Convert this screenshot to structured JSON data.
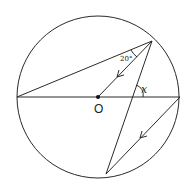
{
  "diagram": {
    "type": "circle-geometry",
    "circle": {
      "cx": 98,
      "cy": 97,
      "r": 81
    },
    "center": {
      "x": 98,
      "y": 97,
      "label": "O"
    },
    "points": {
      "A": {
        "x": 152,
        "y": 41
      },
      "B": {
        "x": 106,
        "y": 174
      },
      "L": {
        "x": 17,
        "y": 97
      },
      "R": {
        "x": 180,
        "y": 97
      }
    },
    "segments": [
      {
        "name": "diameter",
        "from": "L",
        "to": "R"
      },
      {
        "name": "chord-LA",
        "from": "L",
        "to": "A"
      },
      {
        "name": "radius-OA",
        "from": "O",
        "to": "A",
        "parallel_marker": true
      },
      {
        "name": "chord-AB",
        "from": "A",
        "to": "B"
      },
      {
        "name": "chord-RB",
        "from": "R",
        "to": "B",
        "parallel_marker": true
      }
    ],
    "labels": {
      "angle_given": "20°",
      "angle_unknown": "x",
      "center": "O"
    }
  }
}
